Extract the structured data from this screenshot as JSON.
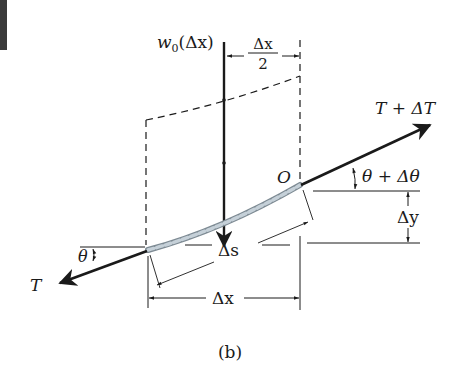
{
  "figure": {
    "caption": "(b)",
    "labels": {
      "load": "w",
      "load_sub": "0",
      "load_arg": "(Δx)",
      "half_dx_num": "Δx",
      "half_dx_den": "2",
      "tension_right": "T + ΔT",
      "angle_right": "θ + Δθ",
      "point_o": "O",
      "delta_y": "Δy",
      "delta_s": "Δs",
      "delta_x": "Δx",
      "tension_left": "T",
      "angle_left": "θ"
    },
    "colors": {
      "ink": "#1a1a1a",
      "cable_fill": "#b8c4cc",
      "corner_bar": "#3a3a3a"
    }
  }
}
